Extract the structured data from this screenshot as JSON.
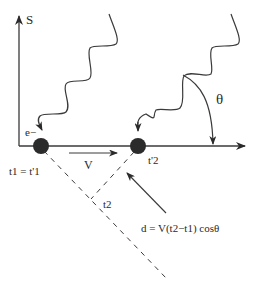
{
  "labels": {
    "axis_vertical": "S",
    "electron": "e−",
    "velocity": "V",
    "t1_eq": "t1 = t'1",
    "t2_prime": "t'2",
    "t2": "t2",
    "theta": "θ",
    "formula": "d = V(t2−t1) cosθ"
  },
  "colors": {
    "line": "#3a3a3a",
    "electron": "#2b2b2b",
    "background": "#ffffff"
  }
}
